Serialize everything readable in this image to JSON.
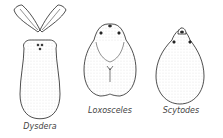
{
  "figure": {
    "specimens": [
      {
        "name": "Dysdera",
        "label": "Dysdera"
      },
      {
        "name": "Loxosceles",
        "label": "Loxosceles"
      },
      {
        "name": "Scytodes",
        "label": "Scytodes"
      }
    ]
  }
}
